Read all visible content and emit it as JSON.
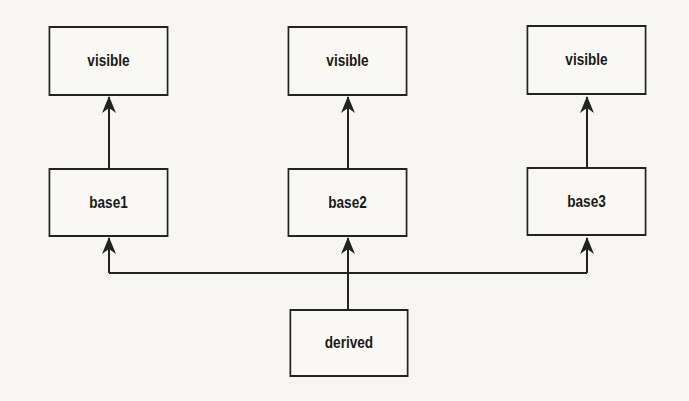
{
  "diagram": {
    "nodes": [
      {
        "id": "visible1",
        "label": "visible"
      },
      {
        "id": "visible2",
        "label": "visible"
      },
      {
        "id": "visible3",
        "label": "visible"
      },
      {
        "id": "base1",
        "label": "base1"
      },
      {
        "id": "base2",
        "label": "base2"
      },
      {
        "id": "base3",
        "label": "base3"
      },
      {
        "id": "derived",
        "label": "derived"
      }
    ],
    "edges": [
      {
        "from": "base1",
        "to": "visible1"
      },
      {
        "from": "base2",
        "to": "visible2"
      },
      {
        "from": "base3",
        "to": "visible3"
      },
      {
        "from": "derived",
        "to": "base1"
      },
      {
        "from": "derived",
        "to": "base2"
      },
      {
        "from": "derived",
        "to": "base3"
      }
    ]
  }
}
